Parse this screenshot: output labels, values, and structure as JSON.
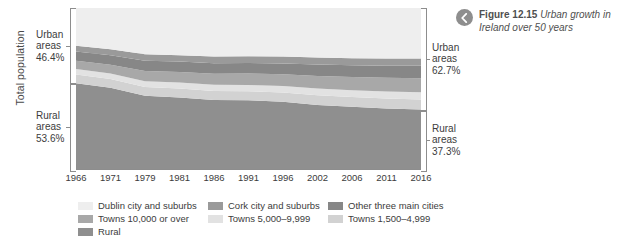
{
  "caption": {
    "icon": "chevron-left-circle-icon",
    "figure_label": "Figure 12.15",
    "figure_title": "Urban growth in Ireland over 50 years"
  },
  "axis": {
    "y_title": "Total population"
  },
  "annotations": {
    "left_urban": {
      "l1": "Urban",
      "l2": "areas",
      "l3": "46.4%"
    },
    "left_rural": {
      "l1": "Rural",
      "l2": "areas",
      "l3": "53.6%"
    },
    "right_urban": {
      "l1": "Urban",
      "l2": "areas",
      "l3": "62.7%"
    },
    "right_rural": {
      "l1": "Rural",
      "l2": "areas",
      "l3": "37.3%"
    }
  },
  "legend": [
    {
      "label": "Dublin city and suburbs",
      "color": "#eeeeee",
      "col": 0
    },
    {
      "label": "Cork city and suburbs",
      "color": "#9a9a9a",
      "col": 1
    },
    {
      "label": "Other three main cities",
      "color": "#878787",
      "col": 2
    },
    {
      "label": "Towns 10,000 or over",
      "color": "#a8a8a8",
      "col": 0
    },
    {
      "label": "Towns 5,000–9,999",
      "color": "#e2e2e2",
      "col": 1
    },
    {
      "label": "Towns 1,500–4,999",
      "color": "#d2d2d2",
      "col": 2
    },
    {
      "label": "Rural",
      "color": "#8f8f8f",
      "col": 0
    }
  ],
  "chart_data": {
    "type": "area",
    "title": "Urban growth in Ireland over 50 years",
    "xlabel": "",
    "ylabel": "Total population",
    "stacked": true,
    "stack_order": "bottom-to-top",
    "grid": true,
    "legend_position": "bottom",
    "categories": [
      1966,
      1971,
      1979,
      1981,
      1986,
      1991,
      1996,
      2002,
      2006,
      2011,
      2016
    ],
    "x_tick_labels": [
      "1966",
      "1971",
      "1979",
      "1981",
      "1986",
      "1991",
      "1996",
      "2002",
      "2006",
      "2011",
      "2016"
    ],
    "ylim": [
      0,
      100
    ],
    "y_unit": "percent of total population",
    "series": [
      {
        "name": "Rural",
        "color": "#8f8f8f",
        "values": [
          53.6,
          50.8,
          45.8,
          44.8,
          43.2,
          43.0,
          42.1,
          40.2,
          39.0,
          38.0,
          37.3
        ]
      },
      {
        "name": "Towns 1,500–4,999",
        "color": "#d2d2d2",
        "values": [
          5.4,
          5.3,
          5.4,
          5.5,
          5.6,
          5.6,
          5.7,
          5.9,
          6.0,
          6.1,
          6.2
        ]
      },
      {
        "name": "Towns 5,000–9,999",
        "color": "#e2e2e2",
        "values": [
          3.3,
          3.4,
          3.6,
          3.7,
          3.8,
          3.9,
          4.0,
          4.2,
          4.3,
          4.4,
          4.5
        ]
      },
      {
        "name": "Towns 10,000 or over",
        "color": "#a8a8a8",
        "values": [
          5.2,
          5.5,
          6.3,
          6.5,
          6.8,
          7.0,
          7.3,
          7.8,
          8.1,
          8.4,
          8.7
        ]
      },
      {
        "name": "Other three main cities",
        "color": "#878787",
        "values": [
          5.6,
          5.8,
          6.3,
          6.4,
          6.5,
          6.6,
          6.7,
          7.0,
          7.2,
          7.4,
          7.6
        ]
      },
      {
        "name": "Cork city and suburbs",
        "color": "#9a9a9a",
        "values": [
          3.6,
          3.7,
          4.0,
          4.0,
          4.1,
          4.1,
          4.2,
          4.3,
          4.4,
          4.5,
          4.6
        ]
      },
      {
        "name": "Dublin city and suburbs",
        "color": "#eeeeee",
        "values": [
          23.3,
          25.5,
          28.6,
          29.1,
          30.0,
          29.8,
          30.0,
          30.6,
          31.0,
          31.2,
          31.1
        ]
      }
    ],
    "annotations": [
      {
        "text": "Urban areas 46.4%",
        "position": "left",
        "value": 46.4
      },
      {
        "text": "Rural areas 53.6%",
        "position": "left",
        "value": 53.6
      },
      {
        "text": "Urban areas 62.7%",
        "position": "right",
        "value": 62.7
      },
      {
        "text": "Rural areas 37.3%",
        "position": "right",
        "value": 37.3
      }
    ],
    "gridline_values": [
      96,
      88,
      80,
      72
    ]
  }
}
